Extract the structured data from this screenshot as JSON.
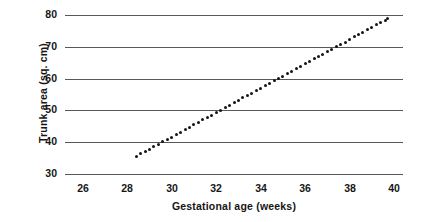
{
  "chart_data": {
    "type": "scatter",
    "title": "",
    "xlabel": "Gestational age (weeks)",
    "ylabel": "Trunk area (sq. cm)",
    "xlim": [
      25.2,
      40.4
    ],
    "ylim": [
      28.5,
      81.5
    ],
    "grid": "horizontal",
    "legend": "none",
    "marker": "filled-circle",
    "series_name": "Fetal trunk area",
    "xticks": [
      26,
      28,
      30,
      32,
      34,
      36,
      38,
      40
    ],
    "xticklabels": [
      "26",
      "28",
      "30",
      "32",
      "34",
      "36",
      "38",
      "40"
    ],
    "yticks": [
      30,
      40,
      50,
      60,
      70,
      80
    ],
    "yticklabels": [
      "30",
      "40",
      "50",
      "60",
      "70",
      "80"
    ],
    "x": [
      28.4,
      28.6,
      28.8,
      29.0,
      29.2,
      29.4,
      29.6,
      29.8,
      30.0,
      30.2,
      30.4,
      30.6,
      30.8,
      31.0,
      31.2,
      31.4,
      31.6,
      31.8,
      32.0,
      32.2,
      32.4,
      32.6,
      32.8,
      33.0,
      33.2,
      33.4,
      33.6,
      33.8,
      34.0,
      34.2,
      34.4,
      34.6,
      34.8,
      35.0,
      35.2,
      35.4,
      35.6,
      35.8,
      36.0,
      36.2,
      36.4,
      36.6,
      36.8,
      37.0,
      37.2,
      37.4,
      37.6,
      37.8,
      38.0,
      38.2,
      38.4,
      38.6,
      38.8,
      39.0,
      39.2,
      39.4,
      39.6,
      39.7
    ],
    "y": [
      35.5,
      36.3,
      37.0,
      37.8,
      38.6,
      39.3,
      40.1,
      40.9,
      41.6,
      42.4,
      43.2,
      43.9,
      44.7,
      45.5,
      46.2,
      47.0,
      47.8,
      48.5,
      49.3,
      50.1,
      50.8,
      51.6,
      52.4,
      53.1,
      53.9,
      54.7,
      55.4,
      56.2,
      57.0,
      57.7,
      58.5,
      59.3,
      60.0,
      60.8,
      61.6,
      62.3,
      63.1,
      63.9,
      64.6,
      65.4,
      66.2,
      66.9,
      67.7,
      68.5,
      69.2,
      70.0,
      70.8,
      71.5,
      72.3,
      73.1,
      73.8,
      74.6,
      75.4,
      76.1,
      76.9,
      77.7,
      78.4,
      78.8
    ],
    "units_y": "sq. cm",
    "units_x": "weeks",
    "trend": "linear",
    "slope_per_week": 3.85,
    "colors": {
      "marker": "#141414",
      "gridline": "#585858",
      "background": "#ffffff",
      "text": "#161616"
    }
  }
}
